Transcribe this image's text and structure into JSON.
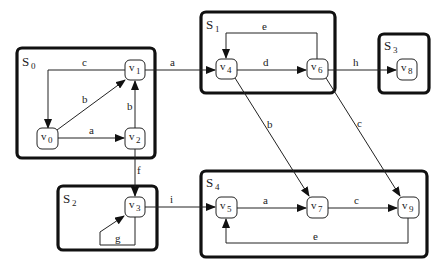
{
  "diagram": {
    "groups": [
      {
        "id": "S0",
        "label": "S",
        "sub": "0"
      },
      {
        "id": "S1",
        "label": "S",
        "sub": "1"
      },
      {
        "id": "S2",
        "label": "S",
        "sub": "2"
      },
      {
        "id": "S3",
        "label": "S",
        "sub": "3"
      },
      {
        "id": "S4",
        "label": "S",
        "sub": "4"
      }
    ],
    "nodes": [
      {
        "id": "v0",
        "label": "v",
        "sub": "0",
        "group": "S0"
      },
      {
        "id": "v1",
        "label": "v",
        "sub": "1",
        "group": "S0"
      },
      {
        "id": "v2",
        "label": "v",
        "sub": "2",
        "group": "S0"
      },
      {
        "id": "v3",
        "label": "v",
        "sub": "3",
        "group": "S2"
      },
      {
        "id": "v4",
        "label": "v",
        "sub": "4",
        "group": "S1"
      },
      {
        "id": "v5",
        "label": "v",
        "sub": "5",
        "group": "S4"
      },
      {
        "id": "v6",
        "label": "v",
        "sub": "6",
        "group": "S1"
      },
      {
        "id": "v7",
        "label": "v",
        "sub": "7",
        "group": "S4"
      },
      {
        "id": "v8",
        "label": "v",
        "sub": "8",
        "group": "S3"
      },
      {
        "id": "v9",
        "label": "v",
        "sub": "9",
        "group": "S4"
      }
    ],
    "edges": [
      {
        "from": "v1",
        "to": "v0",
        "label": "c"
      },
      {
        "from": "v0",
        "to": "v1",
        "label": "b"
      },
      {
        "from": "v0",
        "to": "v2",
        "label": "a"
      },
      {
        "from": "v2",
        "to": "v1",
        "label": "b"
      },
      {
        "from": "v1",
        "to": "v4",
        "label": "a"
      },
      {
        "from": "v2",
        "to": "v3",
        "label": "f"
      },
      {
        "from": "v3",
        "to": "v3",
        "label": "g"
      },
      {
        "from": "v3",
        "to": "v5",
        "label": "i"
      },
      {
        "from": "v4",
        "to": "v6",
        "label": "d"
      },
      {
        "from": "v6",
        "to": "v4",
        "label": "e"
      },
      {
        "from": "v6",
        "to": "v8",
        "label": "h"
      },
      {
        "from": "v4",
        "to": "v7",
        "label": "b"
      },
      {
        "from": "v6",
        "to": "v9",
        "label": "c"
      },
      {
        "from": "v5",
        "to": "v7",
        "label": "a"
      },
      {
        "from": "v7",
        "to": "v9",
        "label": "c"
      },
      {
        "from": "v9",
        "to": "v5",
        "label": "e"
      }
    ]
  }
}
